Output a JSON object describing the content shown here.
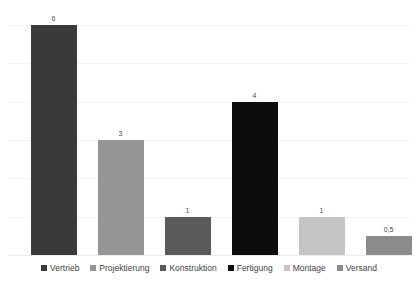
{
  "chart_data": {
    "type": "bar",
    "title": "",
    "subtitle": "",
    "xlabel": "",
    "ylabel": "",
    "ylim": [
      0,
      6
    ],
    "grid": true,
    "gridlines": [
      1,
      2,
      3,
      4,
      5,
      6
    ],
    "legend_position": "bottom",
    "axis_tick_labels": [],
    "categories": [
      "Vertrieb",
      "Projektierung",
      "Konstruktion",
      "Fertigung",
      "Montage",
      "Versand"
    ],
    "values": [
      6,
      3,
      1,
      4,
      1,
      0.5
    ],
    "value_labels": [
      "6",
      "3",
      "1",
      "4",
      "1",
      "0,5"
    ],
    "colors": [
      "#3a3a3a",
      "#969696",
      "#5a5a5a",
      "#0d0d0d",
      "#c4c4c4",
      "#8c8c8c"
    ],
    "bars": [
      {
        "category": "Vertrieb",
        "value": 6,
        "label": "6",
        "color": "#3a3a3a"
      },
      {
        "category": "Projektierung",
        "value": 3,
        "label": "3",
        "color": "#969696"
      },
      {
        "category": "Konstruktion",
        "value": 1,
        "label": "1",
        "color": "#5a5a5a"
      },
      {
        "category": "Fertigung",
        "value": 4,
        "label": "4",
        "color": "#0d0d0d"
      },
      {
        "category": "Montage",
        "value": 1,
        "label": "1",
        "color": "#c4c4c4"
      },
      {
        "category": "Versand",
        "value": 0.5,
        "label": "0,5",
        "color": "#8c8c8c"
      }
    ]
  },
  "legend": {
    "items": [
      {
        "label": "Vertrieb",
        "color": "#3a3a3a"
      },
      {
        "label": "Projektierung",
        "color": "#969696"
      },
      {
        "label": "Konstruktion",
        "color": "#5a5a5a"
      },
      {
        "label": "Fertigung",
        "color": "#0d0d0d"
      },
      {
        "label": "Montage",
        "color": "#c4c4c4"
      },
      {
        "label": "Versand",
        "color": "#8c8c8c"
      }
    ]
  },
  "style": {
    "background": "#ffffff",
    "gridline_color": "#f2f2f2",
    "baseline_color": "#ededed",
    "label_color": "#4a4a4a"
  }
}
